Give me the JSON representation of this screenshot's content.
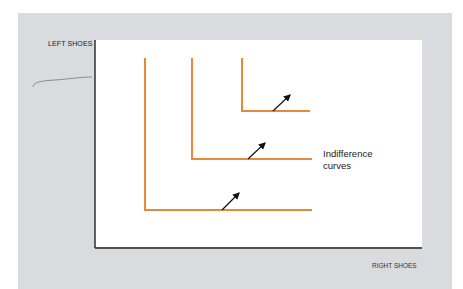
{
  "diagram": {
    "axes": {
      "y_label": "LEFT SHOES",
      "x_label": "RIGHT SHOES"
    },
    "annotation": {
      "line1": "Indifference",
      "line2": "curves"
    },
    "colors": {
      "curve": "#e8883a",
      "axis": "#222222",
      "arrow": "#111111",
      "panel": "#d9dbde"
    },
    "curves": [
      {
        "name": "IC1",
        "corner_x": 145,
        "corner_y": 210,
        "top_y": 58,
        "right_x": 312
      },
      {
        "name": "IC2",
        "corner_x": 192,
        "corner_y": 159,
        "top_y": 58,
        "right_x": 312
      },
      {
        "name": "IC3",
        "corner_x": 242,
        "corner_y": 111,
        "top_y": 58,
        "right_x": 310
      }
    ]
  }
}
